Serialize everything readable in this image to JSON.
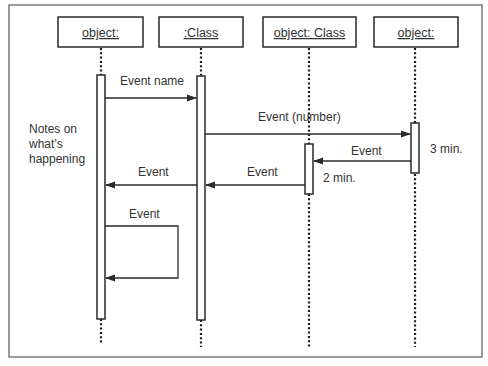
{
  "diagram": {
    "type": "UML sequence diagram",
    "objects": [
      {
        "id": "obj1",
        "label": "object:",
        "x": 101
      },
      {
        "id": "obj2",
        "label": ":Class",
        "x": 201
      },
      {
        "id": "obj3",
        "label": "object: Class",
        "x": 309
      },
      {
        "id": "obj4",
        "label": "object:",
        "x": 415
      }
    ],
    "messages": [
      {
        "label": "Event name",
        "from": "object:",
        "to": ":Class",
        "direction": "right"
      },
      {
        "label": "Event (number)",
        "from": ":Class",
        "to": "object:",
        "direction": "right"
      },
      {
        "label": "Event",
        "from": "object:",
        "to": "object: Class",
        "direction": "left"
      },
      {
        "label": "Event",
        "from": "object: Class",
        "to": ":Class",
        "direction": "left"
      },
      {
        "label": "Event",
        "from": ":Class",
        "to": "object:",
        "direction": "left"
      },
      {
        "label": "Event",
        "from": "object:",
        "to": "object:",
        "direction": "self"
      }
    ],
    "note": [
      "Notes on",
      "what’s",
      "happening"
    ],
    "durations": [
      {
        "label": "3 min.",
        "object": "object:"
      },
      {
        "label": "2 min.",
        "object": "object: Class"
      }
    ]
  },
  "text": {
    "obj1": "object:",
    "obj2": ":Class",
    "obj3": "object: Class",
    "obj4": "object:",
    "msg_event_name": "Event name",
    "msg_event_number": "Event (number)",
    "msg_event_4to3": "Event",
    "msg_event_3to2": "Event",
    "msg_event_2to1": "Event",
    "msg_event_self": "Event",
    "note_line1": "Notes on",
    "note_line2": "what’s",
    "note_line3": "happening",
    "duration_3min": "3 min.",
    "duration_2min": "2 min."
  }
}
